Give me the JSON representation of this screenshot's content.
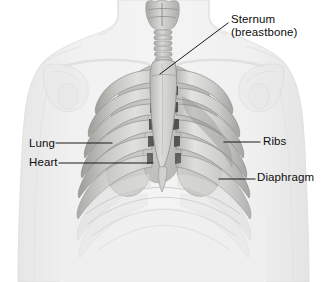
{
  "figure": {
    "background_color": "#ffffff",
    "text_color": "#0d0d0d",
    "line_color": "#1a1a1a"
  },
  "labels": {
    "sternum": {
      "line1": "Sternum",
      "line2": "(breastbone)"
    },
    "lung": "Lung",
    "heart": "Heart",
    "ribs": "Ribs",
    "diaphragm": "Diaphragm"
  },
  "structures": {
    "body_silhouette": "body-silhouette",
    "trachea": "trachea",
    "larynx": "larynx",
    "sternum_bone": "sternum-bone",
    "xiphoid_process": "xiphoid-process",
    "clavicle_left": "clavicle-left",
    "clavicle_right": "clavicle-right",
    "scapula_left": "scapula-left",
    "scapula_right": "scapula-right",
    "ribcage_left": "ribcage-left",
    "ribcage_right": "ribcage-right",
    "lung_left": "lung-left",
    "lung_right": "lung-right",
    "heart_organ": "heart-organ",
    "diaphragm_arch": "diaphragm-arch"
  },
  "colors": {
    "skin_pale": "#ececec",
    "skin_edge": "#d8d8d8",
    "bone_light": "#e2e2e0",
    "bone_mid": "#c9c9c6",
    "bone_dark": "#a9a9a6",
    "shadow": "#8f8f8d",
    "deep_shadow": "#4a4a4a",
    "lung_tone": "#bdbdba",
    "heart_tone": "#d5d5d2"
  },
  "leader_lines": {
    "sternum": {
      "x1": 228,
      "y1": 23,
      "x2": 160,
      "y2": 74
    },
    "lung": {
      "x1": 56,
      "y1": 143,
      "x2": 112,
      "y2": 143
    },
    "heart": {
      "x1": 59,
      "y1": 163,
      "x2": 153,
      "y2": 163
    },
    "ribs": {
      "x1": 224,
      "y1": 142,
      "x2": 260,
      "y2": 142
    },
    "diaphragm": {
      "x1": 219,
      "y1": 179,
      "x2": 255,
      "y2": 179
    }
  }
}
